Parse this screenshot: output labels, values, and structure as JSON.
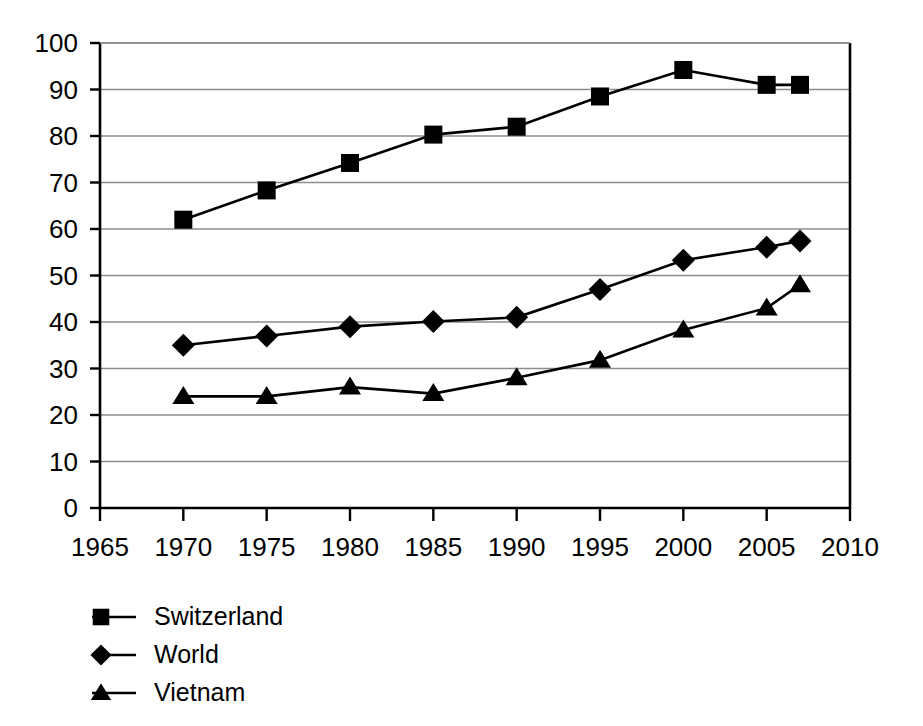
{
  "chart_data": {
    "type": "line",
    "title": "",
    "subtitle": "",
    "xlabel": "",
    "ylabel": "",
    "xlim": [
      1965,
      2010
    ],
    "ylim": [
      0,
      100
    ],
    "grid": true,
    "legend_position": "bottom-left",
    "x_ticks": [
      "1965",
      "1970",
      "1975",
      "1980",
      "1985",
      "1990",
      "1995",
      "2000",
      "2005",
      "2010"
    ],
    "y_ticks": [
      "0",
      "10",
      "20",
      "30",
      "40",
      "50",
      "60",
      "70",
      "80",
      "90",
      "100"
    ],
    "x": [
      1970,
      1975,
      1980,
      1985,
      1990,
      1995,
      2000,
      2005,
      2007
    ],
    "series": [
      {
        "name": "Switzerland",
        "marker": "square",
        "values": [
          62,
          68.3,
          74.2,
          80.3,
          82,
          88.5,
          94.2,
          91,
          91
        ]
      },
      {
        "name": "World",
        "marker": "diamond",
        "values": [
          35,
          37,
          39,
          40.1,
          41,
          47,
          53.3,
          56.1,
          57.4
        ]
      },
      {
        "name": "Vietnam",
        "marker": "triangle",
        "values": [
          24,
          24,
          26,
          24.6,
          28,
          31.8,
          38.3,
          43,
          48
        ]
      }
    ]
  },
  "legend": {
    "items": [
      {
        "label": "Switzerland",
        "marker": "square"
      },
      {
        "label": "World",
        "marker": "diamond"
      },
      {
        "label": "Vietnam",
        "marker": "triangle"
      }
    ]
  },
  "colors": {
    "series": "#000000",
    "grid": "#8c8c8c",
    "axis": "#000000",
    "background": "#ffffff"
  }
}
